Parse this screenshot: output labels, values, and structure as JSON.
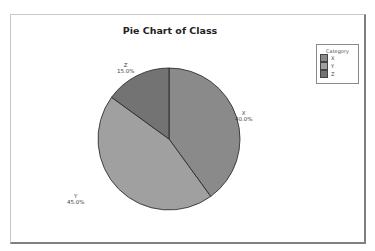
{
  "chart_data": {
    "type": "pie",
    "title": "Pie Chart of Class",
    "categories": [
      "X",
      "Y",
      "Z"
    ],
    "values": [
      40.0,
      45.0,
      15.0
    ],
    "labels": [
      "40.0%",
      "45.0%",
      "15.0%"
    ],
    "colors": [
      "#8a8a8a",
      "#a0a0a0",
      "#737373"
    ],
    "start_angle_deg": 0,
    "direction": "clockwise",
    "legend": {
      "title": "Category",
      "position": "right",
      "entries": [
        "X",
        "Y",
        "Z"
      ]
    }
  },
  "slices": [
    {
      "name": "X",
      "pct": "40.0%"
    },
    {
      "name": "Y",
      "pct": "45.0%"
    },
    {
      "name": "Z",
      "pct": "15.0%"
    }
  ]
}
